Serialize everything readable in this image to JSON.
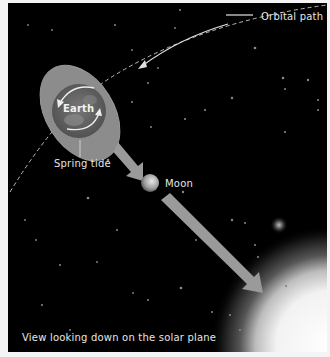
{
  "figure": {
    "caption": "View looking down on the solar plane",
    "labels": {
      "orbital_path": "Orbital path",
      "earth": "Earth",
      "spring_tide": "Spring tide",
      "moon": "Moon"
    },
    "colors": {
      "background": "#000000",
      "frame": "#f4f4f4",
      "tidal_bulge": "#8c8c8c",
      "arrow": "#9a9a9a",
      "text": "#e6e6e6",
      "sun": "#ffffff"
    },
    "elements": [
      {
        "name": "Sun",
        "position": "bottom-right"
      },
      {
        "name": "Moon",
        "position": "center, between Earth and Sun"
      },
      {
        "name": "Earth",
        "position": "upper-left, with elongated tidal bulge"
      },
      {
        "name": "Orbital path",
        "style": "dashed curve"
      }
    ]
  }
}
